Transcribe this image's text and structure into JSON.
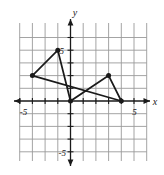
{
  "figure": {
    "kind": "coordinate-plane-polygon",
    "background_color": "#ffffff",
    "grid_color": "#9a9a9a",
    "axis_color": "#1a1a1a",
    "plot_color": "#1a1a1a"
  },
  "axes": {
    "x_axis_label": "x",
    "y_axis_label": "y",
    "x_tick_labels": [
      {
        "text": "-5",
        "value": -5
      },
      {
        "text": "5",
        "value": 5
      }
    ],
    "y_tick_labels": [
      {
        "text": "5",
        "value": 5
      },
      {
        "text": "-5",
        "value": -5
      }
    ],
    "x_range": [
      -6,
      6
    ],
    "y_range": [
      -6,
      5
    ],
    "grid_step": 1,
    "grid_visible": true
  },
  "chart_data": {
    "type": "scatter",
    "title": "",
    "xlabel": "x",
    "ylabel": "y",
    "xlim": [
      -6,
      6
    ],
    "ylim": [
      -6,
      5
    ],
    "grid": true,
    "legend": "none",
    "series": [
      {
        "name": "polygon-outline",
        "closed": true,
        "marker": "filled-circle",
        "x": [
          -3,
          -1,
          0,
          3,
          4
        ],
        "y": [
          2,
          4,
          0,
          2,
          0
        ],
        "points": [
          {
            "label": "A",
            "x": -3,
            "y": 2
          },
          {
            "label": "B",
            "x": -1,
            "y": 4
          },
          {
            "label": "C",
            "x": 0,
            "y": 0
          },
          {
            "label": "D",
            "x": 3,
            "y": 2
          },
          {
            "label": "E",
            "x": 4,
            "y": 0
          }
        ]
      }
    ]
  }
}
